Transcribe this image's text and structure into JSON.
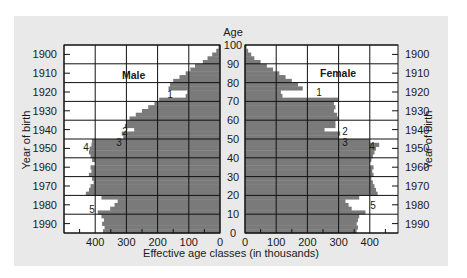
{
  "chart_data": {
    "type": "bar",
    "subtype": "population-pyramid",
    "title": "",
    "center_axis_label": "Age",
    "xlabel": "Effective age classes (in thousands)",
    "ylabel_left": "Year of birth",
    "ylabel_right": "Year of birth",
    "age_ticks": [
      "100",
      "90",
      "80",
      "70",
      "60",
      "50",
      "40",
      "30",
      "20",
      "10",
      "0"
    ],
    "year_ticks": [
      "1900",
      "1910",
      "1920",
      "1930",
      "1940",
      "1950",
      "1960",
      "1970",
      "1980",
      "1990"
    ],
    "male_x_ticks": [
      "400",
      "300",
      "200",
      "100",
      "0"
    ],
    "female_x_ticks": [
      "0",
      "100",
      "200",
      "300",
      "400"
    ],
    "xlim": [
      0,
      500
    ],
    "ylim": [
      0,
      100
    ],
    "grid": true,
    "panels": [
      {
        "name": "Male",
        "label": "Male",
        "side": "left"
      },
      {
        "name": "Female",
        "label": "Female",
        "side": "right"
      }
    ],
    "annotations": [
      {
        "id": "1",
        "text": "1",
        "age": 73,
        "note": "deficit born ~1914-1918"
      },
      {
        "id": "2",
        "text": "2",
        "age": 53,
        "note": "deficit"
      },
      {
        "id": "3",
        "text": "3",
        "age": 48,
        "note": "deficit born ~1945-1946"
      },
      {
        "id": "4",
        "text": "4",
        "age": 45,
        "note": "baby boom"
      },
      {
        "id": "5",
        "text": "5",
        "age": 15,
        "note": "deficit"
      }
    ],
    "ages": [
      0,
      2,
      4,
      6,
      8,
      10,
      12,
      14,
      16,
      18,
      20,
      22,
      24,
      26,
      28,
      30,
      32,
      34,
      36,
      38,
      40,
      42,
      44,
      46,
      48,
      50,
      52,
      54,
      56,
      58,
      60,
      62,
      64,
      66,
      68,
      70,
      72,
      74,
      76,
      78,
      80,
      82,
      84,
      86,
      88,
      90,
      92,
      94,
      96,
      98,
      100
    ],
    "series": [
      {
        "name": "Male",
        "values": [
          375,
          370,
          378,
          372,
          380,
          392,
          352,
          338,
          328,
          380,
          430,
          420,
          415,
          405,
          410,
          420,
          412,
          415,
          400,
          410,
          415,
          420,
          418,
          412,
          410,
          310,
          315,
          275,
          305,
          300,
          290,
          270,
          250,
          230,
          210,
          195,
          110,
          105,
          165,
          160,
          150,
          130,
          110,
          95,
          80,
          55,
          40,
          25,
          12,
          5,
          0
        ]
      },
      {
        "name": "Female",
        "values": [
          358,
          362,
          358,
          362,
          366,
          386,
          342,
          332,
          322,
          366,
          425,
          420,
          415,
          410,
          405,
          412,
          408,
          412,
          400,
          405,
          410,
          415,
          420,
          430,
          400,
          300,
          305,
          255,
          290,
          290,
          300,
          295,
          285,
          290,
          285,
          300,
          120,
          115,
          185,
          170,
          150,
          130,
          110,
          90,
          70,
          50,
          30,
          20,
          10,
          5,
          0
        ]
      }
    ]
  }
}
